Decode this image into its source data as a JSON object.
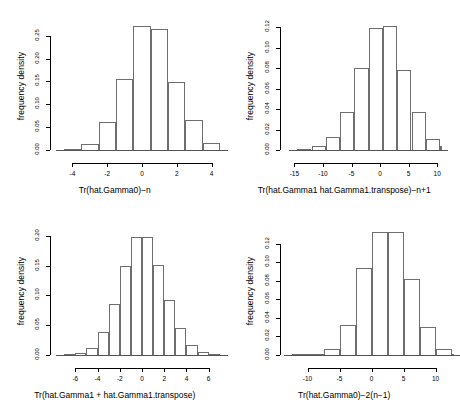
{
  "figure": {
    "type": "histogram-grid",
    "panel_count": 4,
    "background": "#ffffff",
    "bar_border_color": "#6e6e6e",
    "bar_fill_color": "#ffffff",
    "axis_color": "#000000"
  },
  "chart_data": [
    {
      "id": "panel-top-left",
      "type": "bar",
      "title": "",
      "xlabel": "Tr(hat.Gamma0)−n",
      "ylabel": "frequency density",
      "xlim": [
        -4.6,
        4.6
      ],
      "ylim": [
        0,
        0.28
      ],
      "xticks": [
        "-4",
        "-2",
        "0",
        "2",
        "4"
      ],
      "xtick_values": [
        -4,
        -2,
        0,
        2,
        4
      ],
      "yticks": [
        "0.00",
        "0.05",
        "0.10",
        "0.15",
        "0.20",
        "0.25"
      ],
      "ytick_values": [
        0.0,
        0.05,
        0.1,
        0.15,
        0.2,
        0.25
      ],
      "bin_width": 1,
      "bin_edges": [
        -4.5,
        -3.5,
        -2.5,
        -1.5,
        -0.5,
        0.5,
        1.5,
        2.5,
        3.5,
        4.5
      ],
      "values": [
        0.003,
        0.014,
        0.061,
        0.155,
        0.272,
        0.265,
        0.149,
        0.066,
        0.015
      ],
      "grid": false,
      "legend": "none"
    },
    {
      "id": "panel-top-right",
      "type": "bar",
      "title": "",
      "xlabel": "Tr(hat.Gamma1 hat.Gamma1.transpose)−n+1",
      "ylabel": "frequency density",
      "xlim": [
        -15.5,
        12.5
      ],
      "ylim": [
        0,
        0.125
      ],
      "xticks": [
        "-15",
        "-10",
        "-5",
        "0",
        "5",
        "10"
      ],
      "xtick_values": [
        -15,
        -10,
        -5,
        0,
        5,
        10
      ],
      "yticks": [
        "0.00",
        "0.02",
        "0.04",
        "0.06",
        "0.08",
        "0.10",
        "0.12"
      ],
      "ytick_values": [
        0.0,
        0.02,
        0.04,
        0.06,
        0.08,
        0.1,
        0.12
      ],
      "bin_width": 2.5,
      "bin_edges": [
        -14.5,
        -12.0,
        -9.5,
        -7.0,
        -4.5,
        -2.0,
        0.5,
        3.0,
        5.5,
        8.0,
        10.5
      ],
      "values": [
        0.001,
        0.004,
        0.013,
        0.037,
        0.08,
        0.119,
        0.121,
        0.078,
        0.037,
        0.011,
        0.004
      ],
      "grid": false,
      "legend": "none"
    },
    {
      "id": "panel-bottom-left",
      "type": "bar",
      "title": "",
      "xlabel": "Tr(hat.Gamma1 + hat.Gamma1.transpose)",
      "ylabel": "frequency density",
      "xlim": [
        -7.2,
        7.2
      ],
      "ylim": [
        0,
        0.215
      ],
      "xticks": [
        "-6",
        "-4",
        "-2",
        "0",
        "2",
        "4",
        "6"
      ],
      "xtick_values": [
        -6,
        -4,
        -2,
        0,
        2,
        4,
        6
      ],
      "yticks": [
        "0.00",
        "0.05",
        "0.10",
        "0.15",
        "0.20"
      ],
      "ytick_values": [
        0.0,
        0.05,
        0.1,
        0.15,
        0.2
      ],
      "bin_width": 1,
      "bin_edges": [
        -7,
        -6,
        -5,
        -4,
        -3,
        -2,
        -1,
        0,
        1,
        2,
        3,
        4,
        5,
        6,
        7
      ],
      "values": [
        0.001,
        0.004,
        0.012,
        0.038,
        0.086,
        0.15,
        0.199,
        0.198,
        0.152,
        0.092,
        0.046,
        0.017,
        0.005,
        0.001
      ],
      "grid": false,
      "legend": "none"
    },
    {
      "id": "panel-bottom-right",
      "type": "bar",
      "title": "",
      "xlabel": "Tr(hat.Gamma0)−2(n−1)",
      "ylabel": "frequency density",
      "xlim": [
        -12.5,
        12.5
      ],
      "ylim": [
        0,
        0.138
      ],
      "xticks": [
        "-10",
        "-5",
        "0",
        "5",
        "10"
      ],
      "xtick_values": [
        -10,
        -5,
        0,
        5,
        10
      ],
      "yticks": [
        "0.00",
        "0.02",
        "0.04",
        "0.06",
        "0.08",
        "0.10",
        "0.12"
      ],
      "ytick_values": [
        0.0,
        0.02,
        0.04,
        0.06,
        0.08,
        0.1,
        0.12
      ],
      "bin_width": 2.5,
      "bin_edges": [
        -12.5,
        -10.0,
        -7.5,
        -5.0,
        -2.5,
        0.0,
        2.5,
        5.0,
        7.5,
        10.0,
        12.5
      ],
      "values": [
        0.0005,
        0.001,
        0.007,
        0.032,
        0.094,
        0.133,
        0.133,
        0.082,
        0.03,
        0.006,
        0.001
      ],
      "grid": false,
      "legend": "none"
    }
  ]
}
